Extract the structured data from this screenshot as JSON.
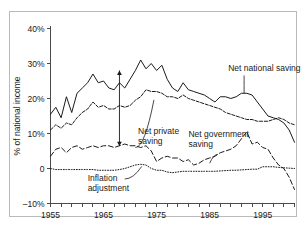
{
  "chart_data": {
    "type": "line",
    "title": "",
    "xlabel": "",
    "ylabel": "% of national income",
    "xlim": [
      1955,
      2001
    ],
    "ylim": [
      -10,
      40
    ],
    "grid": false,
    "legend_position": "inline-annotations",
    "y_ticks": [
      {
        "value": 40,
        "label": "40%"
      },
      {
        "value": 30,
        "label": "30%"
      },
      {
        "value": 20,
        "label": "20%"
      },
      {
        "value": 10,
        "label": "10%"
      },
      {
        "value": 0,
        "label": "0"
      },
      {
        "value": -10,
        "label": "–10%"
      }
    ],
    "x_ticks_labeled": [
      {
        "value": 1955,
        "label": "1955"
      },
      {
        "value": 1965,
        "label": "1965"
      },
      {
        "value": 1975,
        "label": "1975"
      },
      {
        "value": 1985,
        "label": "1985"
      },
      {
        "value": 1995,
        "label": "1995"
      }
    ],
    "x_tick_interval": 2,
    "x_tick_values": [
      1955,
      1957,
      1959,
      1961,
      1963,
      1965,
      1967,
      1969,
      1971,
      1973,
      1975,
      1977,
      1979,
      1981,
      1983,
      1985,
      1987,
      1989,
      1991,
      1993,
      1995,
      1997,
      1999,
      2001
    ],
    "series": [
      {
        "name": "Net national saving",
        "style": "solid",
        "x": [
          1955,
          1956,
          1957,
          1958,
          1959,
          1960,
          1961,
          1962,
          1963,
          1964,
          1965,
          1966,
          1967,
          1968,
          1969,
          1970,
          1971,
          1972,
          1973,
          1974,
          1975,
          1976,
          1977,
          1978,
          1979,
          1980,
          1981,
          1982,
          1983,
          1984,
          1985,
          1986,
          1987,
          1988,
          1989,
          1990,
          1991,
          1992,
          1993,
          1994,
          1995,
          1996,
          1997,
          1998,
          1999,
          2000,
          2001
        ],
        "values": [
          15.5,
          17.5,
          14.5,
          20.5,
          16.0,
          21.5,
          23.0,
          24.5,
          27.0,
          24.5,
          25.0,
          23.0,
          22.5,
          24.5,
          23.0,
          25.5,
          28.0,
          31.0,
          28.5,
          30.0,
          28.0,
          29.5,
          25.5,
          23.0,
          22.0,
          24.5,
          22.5,
          22.0,
          21.5,
          21.0,
          20.0,
          19.0,
          20.5,
          20.5,
          20.0,
          20.5,
          21.5,
          21.5,
          21.0,
          19.0,
          17.0,
          15.0,
          14.5,
          14.0,
          13.0,
          11.0,
          7.5
        ]
      },
      {
        "name": "Net private saving",
        "style": "dashdot",
        "x": [
          1955,
          1956,
          1957,
          1958,
          1959,
          1960,
          1961,
          1962,
          1963,
          1964,
          1965,
          1966,
          1967,
          1968,
          1969,
          1970,
          1971,
          1972,
          1973,
          1974,
          1975,
          1976,
          1977,
          1978,
          1979,
          1980,
          1981,
          1982,
          1983,
          1984,
          1985,
          1986,
          1987,
          1988,
          1989,
          1990,
          1991,
          1992,
          1993,
          1994,
          1995,
          1996,
          1997,
          1998,
          1999,
          2000,
          2001
        ],
        "values": [
          11.0,
          12.5,
          11.5,
          13.0,
          12.5,
          14.5,
          16.0,
          17.0,
          19.0,
          17.5,
          18.0,
          17.0,
          17.0,
          18.0,
          17.5,
          18.0,
          19.5,
          20.5,
          22.5,
          22.0,
          22.0,
          21.5,
          20.5,
          20.5,
          20.0,
          21.0,
          20.0,
          19.5,
          19.0,
          18.5,
          18.0,
          17.5,
          17.0,
          16.0,
          15.5,
          15.0,
          14.5,
          14.0,
          14.0,
          13.5,
          13.5,
          13.5,
          14.0,
          14.5,
          14.0,
          13.0,
          12.5
        ]
      },
      {
        "name": "Net government saving",
        "style": "longdash",
        "x": [
          1955,
          1956,
          1957,
          1958,
          1959,
          1960,
          1961,
          1962,
          1963,
          1964,
          1965,
          1966,
          1967,
          1968,
          1969,
          1970,
          1971,
          1972,
          1973,
          1974,
          1975,
          1976,
          1977,
          1978,
          1979,
          1980,
          1981,
          1982,
          1983,
          1984,
          1985,
          1986,
          1987,
          1988,
          1989,
          1990,
          1991,
          1992,
          1993,
          1994,
          1995,
          1996,
          1997,
          1998,
          1999,
          2000,
          2001
        ],
        "values": [
          3.5,
          5.5,
          6.0,
          4.5,
          6.0,
          6.5,
          5.5,
          6.0,
          6.5,
          6.0,
          6.5,
          6.5,
          6.0,
          6.5,
          7.0,
          6.5,
          6.5,
          6.0,
          6.5,
          5.0,
          2.0,
          3.0,
          3.5,
          3.0,
          3.0,
          2.0,
          2.5,
          1.0,
          1.5,
          2.5,
          3.0,
          3.5,
          4.5,
          5.0,
          5.5,
          6.5,
          8.5,
          10.5,
          7.0,
          7.5,
          6.0,
          5.5,
          3.0,
          1.0,
          0.0,
          -2.5,
          -6.0
        ]
      },
      {
        "name": "Inflation adjustment",
        "style": "dotted",
        "x": [
          1955,
          1956,
          1957,
          1958,
          1959,
          1960,
          1961,
          1962,
          1963,
          1964,
          1965,
          1966,
          1967,
          1968,
          1969,
          1970,
          1971,
          1972,
          1973,
          1974,
          1975,
          1976,
          1977,
          1978,
          1979,
          1980,
          1981,
          1982,
          1983,
          1984,
          1985,
          1986,
          1987,
          1988,
          1989,
          1990,
          1991,
          1992,
          1993,
          1994,
          1995,
          1996,
          1997,
          1998,
          1999,
          2000,
          2001
        ],
        "values": [
          0.0,
          -0.3,
          -0.3,
          -0.3,
          -0.3,
          -0.3,
          -0.3,
          -0.3,
          -0.3,
          -0.5,
          -0.5,
          -0.5,
          -0.5,
          -0.3,
          0.0,
          0.5,
          1.0,
          1.2,
          1.0,
          0.0,
          -0.5,
          -0.5,
          -1.0,
          -1.2,
          -1.0,
          -0.8,
          -0.8,
          -0.8,
          -0.8,
          -0.8,
          -0.8,
          -0.8,
          -0.7,
          -0.6,
          -0.5,
          -0.5,
          -0.4,
          -0.3,
          -0.2,
          -0.2,
          0.5,
          0.5,
          0.5,
          0.3,
          0.2,
          0.1,
          0.0
        ]
      }
    ],
    "annotations": [
      {
        "name": "net-national-saving",
        "text": "Net national saving",
        "text_x": 1988.5,
        "text_y": 28.0,
        "leader_from": {
          "x": 1991.5,
          "y": 26.6
        },
        "leader_to": {
          "x": 1991.5,
          "y": 21.5
        }
      },
      {
        "name": "net-private-saving",
        "text_lines": [
          "Net private",
          "saving"
        ],
        "text_x": 1971.5,
        "text_y": 10.0,
        "leader_from": {
          "x": 1971.0,
          "y": 6.0
        },
        "leader_to": {
          "x": 1974.5,
          "y": 19.6
        }
      },
      {
        "name": "net-government-saving",
        "text_lines": [
          "Net government",
          "saving"
        ],
        "text_x": 1981.0,
        "text_y": 9.0,
        "leader_from": {
          "x": 1986.5,
          "y": 4.0
        },
        "leader_to": {
          "x": 1985.0,
          "y": 1.5
        }
      },
      {
        "name": "inflation-adjustment",
        "text_lines": [
          "Inflation",
          "adjustment"
        ],
        "text_x": 1962.0,
        "text_y": -3.6,
        "leader_from": {
          "x": 1969.0,
          "y": -3.0
        },
        "leader_to": {
          "x": 1972.2,
          "y": 0.6
        }
      }
    ],
    "span_arrow": {
      "name": "net-private-saving-span",
      "x": 1968.0,
      "y_top": 28.0,
      "y_bottom": 6.4,
      "measures": "Net private saving"
    }
  }
}
